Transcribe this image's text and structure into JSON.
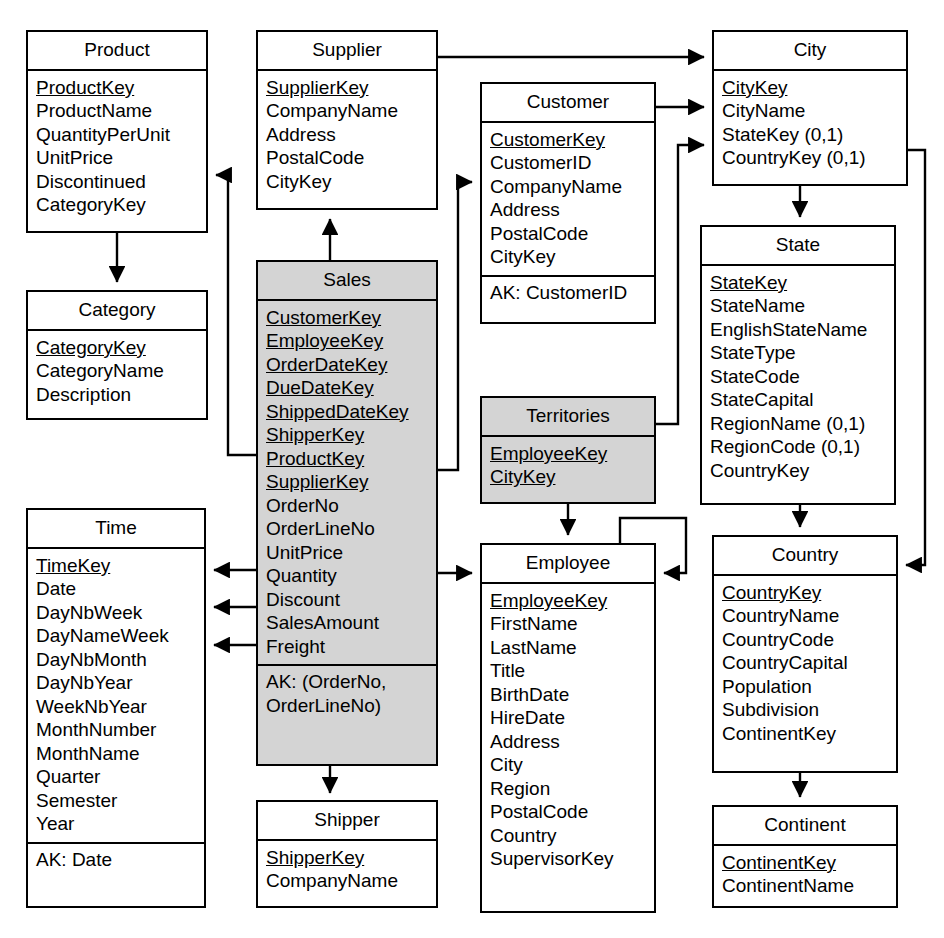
{
  "diagram": {
    "type": "entity-relationship-diagram",
    "canvas": {
      "width": 944,
      "height": 938
    },
    "colors": {
      "fact_table_fill": "#d4d4d4",
      "dimension_table_fill": "#ffffff",
      "line": "#000000",
      "background": "#ffffff"
    }
  },
  "entities": [
    {
      "id": "product",
      "name": "Product",
      "kind": "dimension",
      "x": 26,
      "y": 30,
      "width": 182,
      "height": 203,
      "attributes": [
        {
          "label": "ProductKey",
          "key": true
        },
        {
          "label": "ProductName",
          "key": false
        },
        {
          "label": "QuantityPerUnit",
          "key": false
        },
        {
          "label": "UnitPrice",
          "key": false
        },
        {
          "label": "Discontinued",
          "key": false
        },
        {
          "label": "CategoryKey",
          "key": false
        }
      ],
      "alternate_keys": []
    },
    {
      "id": "category",
      "name": "Category",
      "kind": "dimension",
      "x": 26,
      "y": 290,
      "width": 182,
      "height": 130,
      "attributes": [
        {
          "label": "CategoryKey",
          "key": true
        },
        {
          "label": "CategoryName",
          "key": false
        },
        {
          "label": "Description",
          "key": false
        }
      ],
      "alternate_keys": []
    },
    {
      "id": "supplier",
      "name": "Supplier",
      "kind": "dimension",
      "x": 256,
      "y": 30,
      "width": 182,
      "height": 180,
      "attributes": [
        {
          "label": "SupplierKey",
          "key": true
        },
        {
          "label": "CompanyName",
          "key": false
        },
        {
          "label": "Address",
          "key": false
        },
        {
          "label": "PostalCode",
          "key": false
        },
        {
          "label": "CityKey",
          "key": false
        }
      ],
      "alternate_keys": []
    },
    {
      "id": "sales",
      "name": "Sales",
      "kind": "fact",
      "x": 256,
      "y": 260,
      "width": 182,
      "height": 506,
      "attributes": [
        {
          "label": "CustomerKey",
          "key": true
        },
        {
          "label": "EmployeeKey",
          "key": true
        },
        {
          "label": "OrderDateKey",
          "key": true
        },
        {
          "label": "DueDateKey",
          "key": true
        },
        {
          "label": "ShippedDateKey",
          "key": true
        },
        {
          "label": "ShipperKey",
          "key": true
        },
        {
          "label": "ProductKey",
          "key": true
        },
        {
          "label": "SupplierKey",
          "key": true
        },
        {
          "label": "OrderNo",
          "key": false
        },
        {
          "label": "OrderLineNo",
          "key": false
        },
        {
          "label": "UnitPrice",
          "key": false
        },
        {
          "label": "Quantity",
          "key": false
        },
        {
          "label": "Discount",
          "key": false
        },
        {
          "label": "SalesAmount",
          "key": false
        },
        {
          "label": "Freight",
          "key": false
        }
      ],
      "alternate_keys": [
        "AK: (OrderNo,",
        "OrderLineNo)"
      ]
    },
    {
      "id": "shipper",
      "name": "Shipper",
      "kind": "dimension",
      "x": 256,
      "y": 800,
      "width": 182,
      "height": 108,
      "attributes": [
        {
          "label": "ShipperKey",
          "key": true
        },
        {
          "label": "CompanyName",
          "key": false
        }
      ],
      "alternate_keys": []
    },
    {
      "id": "customer",
      "name": "Customer",
      "kind": "dimension",
      "x": 480,
      "y": 82,
      "width": 176,
      "height": 242,
      "attributes": [
        {
          "label": "CustomerKey",
          "key": true
        },
        {
          "label": "CustomerID",
          "key": false
        },
        {
          "label": "CompanyName",
          "key": false
        },
        {
          "label": "Address",
          "key": false
        },
        {
          "label": "PostalCode",
          "key": false
        },
        {
          "label": "CityKey",
          "key": false
        }
      ],
      "alternate_keys": [
        "AK: CustomerID"
      ]
    },
    {
      "id": "territories",
      "name": "Territories",
      "kind": "fact",
      "x": 480,
      "y": 396,
      "width": 176,
      "height": 108,
      "attributes": [
        {
          "label": "EmployeeKey",
          "key": true
        },
        {
          "label": "CityKey",
          "key": true
        }
      ],
      "alternate_keys": []
    },
    {
      "id": "employee",
      "name": "Employee",
      "kind": "dimension",
      "x": 480,
      "y": 543,
      "width": 176,
      "height": 370,
      "attributes": [
        {
          "label": "EmployeeKey",
          "key": true
        },
        {
          "label": "FirstName",
          "key": false
        },
        {
          "label": "LastName",
          "key": false
        },
        {
          "label": "Title",
          "key": false
        },
        {
          "label": "BirthDate",
          "key": false
        },
        {
          "label": "HireDate",
          "key": false
        },
        {
          "label": "Address",
          "key": false
        },
        {
          "label": "City",
          "key": false
        },
        {
          "label": "Region",
          "key": false
        },
        {
          "label": "PostalCode",
          "key": false
        },
        {
          "label": "Country",
          "key": false
        },
        {
          "label": "SupervisorKey",
          "key": false
        }
      ],
      "alternate_keys": []
    },
    {
      "id": "time",
      "name": "Time",
      "kind": "dimension",
      "x": 26,
      "y": 508,
      "width": 180,
      "height": 400,
      "attributes": [
        {
          "label": "TimeKey",
          "key": true
        },
        {
          "label": "Date",
          "key": false
        },
        {
          "label": "DayNbWeek",
          "key": false
        },
        {
          "label": "DayNameWeek",
          "key": false
        },
        {
          "label": "DayNbMonth",
          "key": false
        },
        {
          "label": "DayNbYear",
          "key": false
        },
        {
          "label": "WeekNbYear",
          "key": false
        },
        {
          "label": "MonthNumber",
          "key": false
        },
        {
          "label": "MonthName",
          "key": false
        },
        {
          "label": "Quarter",
          "key": false
        },
        {
          "label": "Semester",
          "key": false
        },
        {
          "label": "Year",
          "key": false
        }
      ],
      "alternate_keys": [
        "AK: Date"
      ]
    },
    {
      "id": "city",
      "name": "City",
      "kind": "dimension",
      "x": 712,
      "y": 30,
      "width": 196,
      "height": 156,
      "attributes": [
        {
          "label": "CityKey",
          "key": true
        },
        {
          "label": "CityName",
          "key": false
        },
        {
          "label": "StateKey (0,1)",
          "key": false
        },
        {
          "label": "CountryKey (0,1)",
          "key": false
        }
      ],
      "alternate_keys": []
    },
    {
      "id": "state",
      "name": "State",
      "kind": "dimension",
      "x": 700,
      "y": 225,
      "width": 196,
      "height": 280,
      "attributes": [
        {
          "label": "StateKey",
          "key": true
        },
        {
          "label": "StateName",
          "key": false
        },
        {
          "label": "EnglishStateName",
          "key": false
        },
        {
          "label": "StateType",
          "key": false
        },
        {
          "label": "StateCode",
          "key": false
        },
        {
          "label": "StateCapital",
          "key": false
        },
        {
          "label": "RegionName (0,1)",
          "key": false
        },
        {
          "label": "RegionCode (0,1)",
          "key": false
        },
        {
          "label": "CountryKey",
          "key": false
        }
      ],
      "alternate_keys": []
    },
    {
      "id": "country",
      "name": "Country",
      "kind": "dimension",
      "x": 712,
      "y": 535,
      "width": 186,
      "height": 238,
      "attributes": [
        {
          "label": "CountryKey",
          "key": true
        },
        {
          "label": "CountryName",
          "key": false
        },
        {
          "label": "CountryCode",
          "key": false
        },
        {
          "label": "CountryCapital",
          "key": false
        },
        {
          "label": "Population",
          "key": false
        },
        {
          "label": "Subdivision",
          "key": false
        },
        {
          "label": "ContinentKey",
          "key": false
        }
      ],
      "alternate_keys": []
    },
    {
      "id": "continent",
      "name": "Continent",
      "kind": "dimension",
      "x": 712,
      "y": 805,
      "width": 186,
      "height": 103,
      "attributes": [
        {
          "label": "ContinentKey",
          "key": true
        },
        {
          "label": "ContinentName",
          "key": false
        }
      ],
      "alternate_keys": []
    }
  ],
  "relationships": [
    {
      "id": "rel-product-category",
      "from": "product",
      "to": "category",
      "label": ""
    },
    {
      "id": "rel-supplier-city",
      "from": "supplier",
      "to": "city",
      "label": ""
    },
    {
      "id": "rel-customer-city",
      "from": "customer",
      "to": "city",
      "label": ""
    },
    {
      "id": "rel-territories-city",
      "from": "territories",
      "to": "city",
      "label": ""
    },
    {
      "id": "rel-city-state",
      "from": "city",
      "to": "state",
      "label": ""
    },
    {
      "id": "rel-city-country",
      "from": "city",
      "to": "country",
      "label": ""
    },
    {
      "id": "rel-state-country",
      "from": "state",
      "to": "country",
      "label": ""
    },
    {
      "id": "rel-country-continent",
      "from": "country",
      "to": "continent",
      "label": ""
    },
    {
      "id": "rel-sales-supplier",
      "from": "sales",
      "to": "supplier",
      "label": ""
    },
    {
      "id": "rel-sales-product",
      "from": "sales",
      "to": "product",
      "label": ""
    },
    {
      "id": "rel-sales-customer",
      "from": "sales",
      "to": "customer",
      "label": ""
    },
    {
      "id": "rel-sales-employee",
      "from": "sales",
      "to": "employee",
      "label": ""
    },
    {
      "id": "rel-sales-shipper",
      "from": "sales",
      "to": "shipper",
      "label": ""
    },
    {
      "id": "rel-sales-time-orderdate",
      "from": "sales",
      "to": "time",
      "label": ""
    },
    {
      "id": "rel-sales-time-duedate",
      "from": "sales",
      "to": "time",
      "label": ""
    },
    {
      "id": "rel-sales-time-shippeddate",
      "from": "sales",
      "to": "time",
      "label": ""
    },
    {
      "id": "rel-territories-employee",
      "from": "territories",
      "to": "employee",
      "label": ""
    },
    {
      "id": "rel-employee-supervisor",
      "from": "employee",
      "to": "employee",
      "label": ""
    }
  ]
}
